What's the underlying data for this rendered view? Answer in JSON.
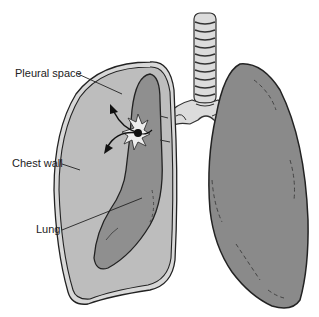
{
  "diagram": {
    "labels": {
      "pleural_space": "Pleural space",
      "chest_wall": "Chest wall",
      "lung": "Lung"
    },
    "colors": {
      "chest_wall_outer": "#d8d8d8",
      "pleural_space_fill": "#bdbdbd",
      "collapsed_lung_fill": "#8f8f8f",
      "normal_lung_fill": "#8a8a8a",
      "trachea_fill": "#dcdcdc",
      "outline": "#2a2a2a",
      "puncture": "#111111"
    }
  }
}
